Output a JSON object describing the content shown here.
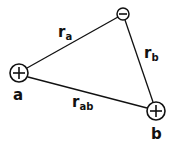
{
  "diagram": {
    "charges": [
      {
        "id": "a",
        "sign": "+",
        "label": "a",
        "cx": 19,
        "cy": 73,
        "r": 9
      },
      {
        "id": "b",
        "sign": "+",
        "label": "b",
        "cx": 156,
        "cy": 111,
        "r": 9
      },
      {
        "id": "neg",
        "sign": "−",
        "label": "",
        "cx": 123,
        "cy": 14,
        "r": 6
      }
    ],
    "distances": [
      {
        "id": "ra",
        "main": "r",
        "sub": "a",
        "from": "a",
        "to": "neg"
      },
      {
        "id": "rb",
        "main": "r",
        "sub": "b",
        "from": "neg",
        "to": "b"
      },
      {
        "id": "rab",
        "main": "r",
        "sub": "ab",
        "from": "a",
        "to": "b"
      }
    ],
    "colors": {
      "stroke": "#111111",
      "background": "#ffffff"
    }
  }
}
